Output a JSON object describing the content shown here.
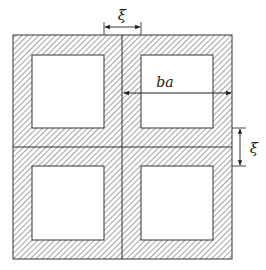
{
  "diagram": {
    "colors": {
      "stroke": "#333333",
      "hatch": "#555555",
      "background": "#ffffff",
      "void": "#ffffff"
    },
    "outer": {
      "x": 13,
      "y": 35,
      "w": 219,
      "h": 224
    },
    "dividers": {
      "vertical_x": 122,
      "horizontal_y": 147
    },
    "voids": [
      {
        "id": "top-left",
        "x": 32,
        "y": 55,
        "w": 72,
        "h": 73
      },
      {
        "id": "top-right",
        "x": 141,
        "y": 55,
        "w": 72,
        "h": 73
      },
      {
        "id": "bottom-left",
        "x": 32,
        "y": 166,
        "w": 72,
        "h": 74
      },
      {
        "id": "bottom-right",
        "x": 141,
        "y": 166,
        "w": 72,
        "h": 74
      }
    ],
    "dimensions": {
      "top_gap": {
        "label": "ξ"
      },
      "cell_width": {
        "label": "ba"
      },
      "right_gap": {
        "label": "ξ"
      }
    }
  }
}
